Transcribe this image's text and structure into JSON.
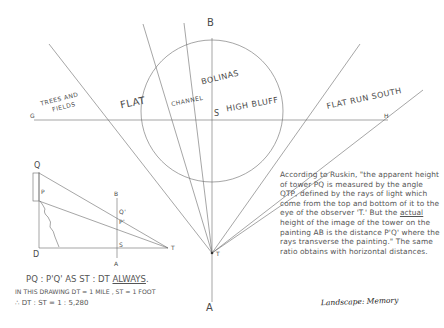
{
  "colors": {
    "line": "#6a6a6a",
    "text": "#4a4a4a",
    "background": "#ffffff"
  },
  "main_diagram": {
    "points": {
      "G": "G",
      "H": "H",
      "S": "S",
      "B": "B",
      "A": "A",
      "T": "T"
    },
    "regions": {
      "trees_fields_1": "TREES AND",
      "trees_fields_2": "FIELDS",
      "flat": "FLAT",
      "channel": "CHANNEL",
      "bolinas": "BOLINAS",
      "high_bluff": "HIGH BLUFF",
      "flat_run_south": "FLAT RUN SOUTH"
    }
  },
  "inset_diagram": {
    "points": {
      "Q": "Q",
      "P": "P",
      "D": "D",
      "B": "B",
      "A": "A",
      "S": "S",
      "T": "T",
      "Q_prime": "Q'",
      "P_prime": "P'"
    }
  },
  "formulas": {
    "line1": "PQ : P'Q' AS  ST : DT ",
    "line1_emph": "ALWAYS",
    "line1_end": ".",
    "line2": "IN THIS DRAWING  DT = 1 MILE ,  ST = 1 FOOT",
    "line3": "∴  DT : ST = 1 : 5,280"
  },
  "note": {
    "part1": "According to Ruskin, \"the apparent height of tower PQ is measured by the angle QTP, defined by the rays of light which come from the top and bottom of it to the eye of the observer 'T.' But the ",
    "emph": "actual",
    "part2": " height of the image of the tower on the painting AB is the distance P'Q' where the rays transverse the painting.\" The same ratio obtains with horizontal distances."
  },
  "caption": "Landscape: Memory"
}
